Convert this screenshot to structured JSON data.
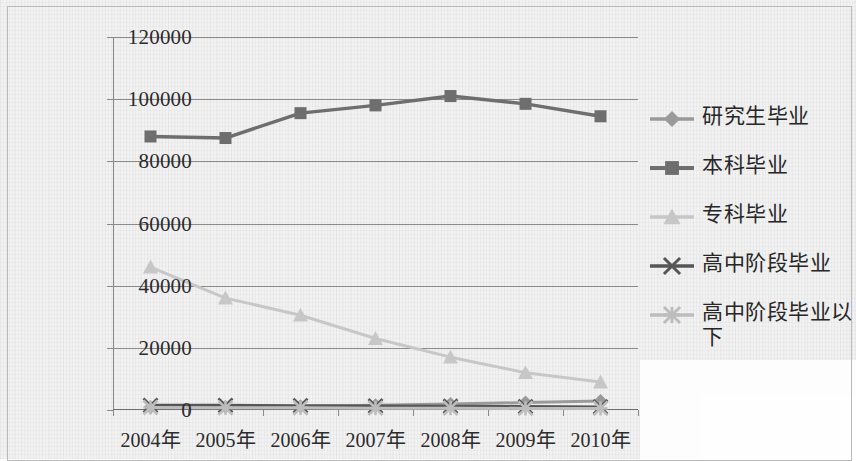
{
  "chart_data": {
    "type": "line",
    "title": "",
    "xlabel": "",
    "ylabel": "",
    "categories": [
      "2004年",
      "2005年",
      "2006年",
      "2007年",
      "2008年",
      "2009年",
      "2010年"
    ],
    "ylim": [
      0,
      120000
    ],
    "yticks": [
      0,
      20000,
      40000,
      60000,
      80000,
      100000,
      120000
    ],
    "ytick_labels": [
      "0",
      "20000",
      "40000",
      "60000",
      "80000",
      "100000",
      "120000"
    ],
    "grid": true,
    "legend_position": "right",
    "series": [
      {
        "name": "研究生毕业",
        "marker": "diamond",
        "color": "#9a9a9a",
        "values": [
          900,
          1000,
          1200,
          1500,
          1900,
          2400,
          2900
        ]
      },
      {
        "name": "本科毕业",
        "marker": "square",
        "color": "#6e6e6e",
        "values": [
          88000,
          87500,
          95500,
          98000,
          101000,
          98500,
          94500
        ]
      },
      {
        "name": "专科毕业",
        "marker": "triangle",
        "color": "#c7c7c7",
        "values": [
          46000,
          36000,
          30500,
          23000,
          17000,
          12000,
          9000
        ]
      },
      {
        "name": "高中阶段毕业",
        "marker": "cross",
        "color": "#565656",
        "values": [
          1500,
          1500,
          1400,
          1300,
          1200,
          1100,
          1000
        ]
      },
      {
        "name": "高中阶段毕业以下",
        "marker": "star",
        "color": "#bdbdbd",
        "values": [
          800,
          700,
          700,
          600,
          600,
          500,
          500
        ]
      }
    ]
  },
  "legend": {
    "items": [
      {
        "label": "研究生毕业",
        "marker": "diamond",
        "color": "#9a9a9a"
      },
      {
        "label": "本科毕业",
        "marker": "square",
        "color": "#6e6e6e"
      },
      {
        "label": "专科毕业",
        "marker": "triangle",
        "color": "#c7c7c7"
      },
      {
        "label": "高中阶段毕业",
        "marker": "cross",
        "color": "#565656"
      },
      {
        "label": "高中阶段毕业以下",
        "marker": "star",
        "color": "#bdbdbd"
      }
    ]
  },
  "colors": {
    "gridline": "#8a8a8a",
    "axis": "#6f6f6f",
    "text": "#2b2b2b",
    "frame": "#b9b9b9",
    "background": "#f2f2f2"
  }
}
